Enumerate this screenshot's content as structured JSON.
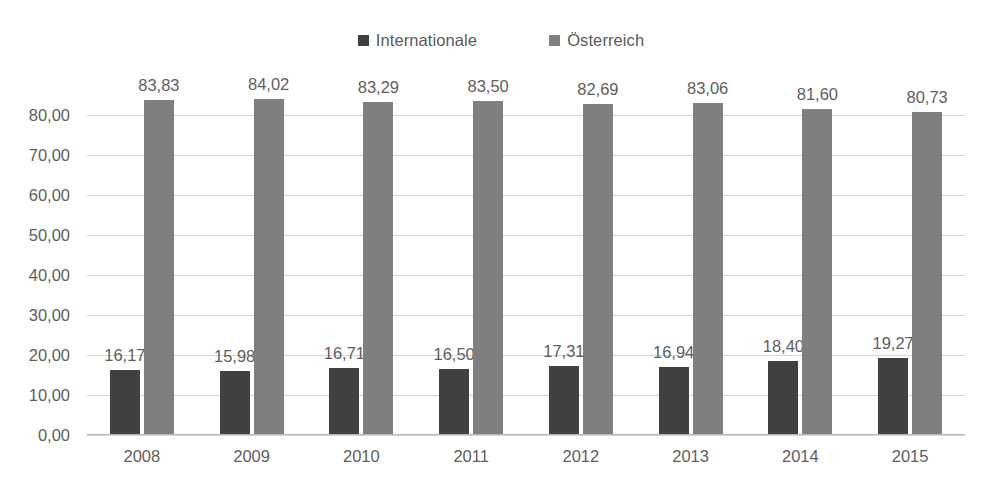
{
  "chart_data": {
    "type": "bar",
    "title": "",
    "subtitle": "",
    "xlabel": "",
    "ylabel": "",
    "categories": [
      "2008",
      "2009",
      "2010",
      "2011",
      "2012",
      "2013",
      "2014",
      "2015"
    ],
    "series": [
      {
        "name": "Internationale",
        "color": "#414141",
        "values": [
          16.17,
          15.98,
          16.71,
          16.5,
          17.31,
          16.94,
          18.4,
          19.27
        ],
        "labels": [
          "16,17",
          "15,98",
          "16,71",
          "16,50",
          "17,31",
          "16,94",
          "18,40",
          "19,27"
        ]
      },
      {
        "name": "Österreich",
        "color": "#7f7f7f",
        "values": [
          83.83,
          84.02,
          83.29,
          83.5,
          82.69,
          83.06,
          81.6,
          80.73
        ],
        "labels": [
          "83,83",
          "84,02",
          "83,29",
          "83,50",
          "82,69",
          "83,06",
          "81,60",
          "80,73"
        ]
      }
    ],
    "ylim": [
      0,
      90
    ],
    "ytick_values": [
      0,
      10,
      20,
      30,
      40,
      50,
      60,
      70,
      80
    ],
    "ytick_labels": [
      "0,00",
      "10,00",
      "20,00",
      "30,00",
      "40,00",
      "50,00",
      "60,00",
      "70,00",
      "80,00"
    ],
    "grid": "horizontal",
    "legend_position": "top-center",
    "decimal_separator": ","
  },
  "legend": {
    "items": [
      {
        "label": "Internationale",
        "swatch_color": "#414141"
      },
      {
        "label": "Österreich",
        "swatch_color": "#7f7f7f"
      }
    ]
  }
}
